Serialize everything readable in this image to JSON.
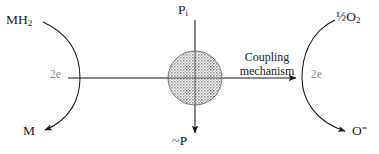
{
  "diagram": {
    "type": "biochemical-schematic",
    "canvas": {
      "width": 379,
      "height": 154
    },
    "colors": {
      "stroke": "#1a1a1a",
      "text": "#1a1a1a",
      "muted_text": "#8c8c8c",
      "circle_fill": "#9a9a9a",
      "background": "#ffffff"
    },
    "labels": {
      "substrate_reduced": "MH",
      "substrate_reduced_sub": "2",
      "substrate_oxidized": "M",
      "phosphate": "P",
      "phosphate_sub": "i",
      "high_energy_phosphate": "~P",
      "oxygen": "½O",
      "oxygen_sub": "2",
      "oxide": "O",
      "oxide_sup": "=",
      "electrons_left": "2e",
      "electrons_right": "2e",
      "coupling_line1": "Coupling",
      "coupling_line2": "mechanism"
    },
    "elements": {
      "left_arc": {
        "name": "substrate-oxidation-arc",
        "from": "MH2",
        "to": "M",
        "arrowhead": "at-M"
      },
      "right_arc": {
        "name": "oxygen-reduction-arc",
        "from": "½O2",
        "to": "O=",
        "arrowhead": "at-O"
      },
      "horizontal_axis": {
        "name": "electron-transport-axis",
        "arrowhead": "at-right"
      },
      "vertical_axis": {
        "name": "phosphorylation-axis",
        "arrowhead": "at-bottom"
      },
      "center_circle": {
        "name": "coupling-black-box",
        "fill": "stippled-gray",
        "cx": 195,
        "cy": 78,
        "r": 27
      }
    }
  }
}
